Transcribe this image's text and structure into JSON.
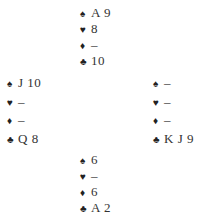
{
  "hands": {
    "north": {
      "spades": "A 9",
      "hearts": "8",
      "diamonds": "–",
      "clubs": "10"
    },
    "west": {
      "spades": "J 10",
      "hearts": "–",
      "diamonds": "–",
      "clubs": "Q 8"
    },
    "east": {
      "spades": "–",
      "hearts": "–",
      "diamonds": "–",
      "clubs": "K J 9"
    },
    "south": {
      "spades": "6",
      "hearts": "–",
      "diamonds": "6",
      "clubs": "A 2"
    }
  },
  "suit_symbols": {
    "spades": "♠",
    "hearts": "♥",
    "diamonds": "♦",
    "clubs": "♣"
  }
}
